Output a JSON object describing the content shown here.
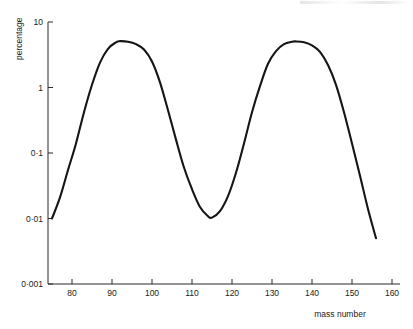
{
  "chart_data": {
    "type": "line",
    "title": "",
    "subtitle": "",
    "xlabel": "mass number",
    "ylabel": "percentage",
    "yscale": "log",
    "xscale": "linear",
    "xlim": [
      74,
      162
    ],
    "ylim": [
      0.001,
      10
    ],
    "grid": false,
    "legend": null,
    "x_ticks": [
      80,
      90,
      100,
      110,
      120,
      130,
      140,
      150,
      160
    ],
    "x_tick_labels": [
      "80",
      "90",
      "100",
      "110",
      "120",
      "130",
      "140",
      "150",
      "160"
    ],
    "y_ticks": [
      10,
      1,
      0.1,
      0.01,
      0.001
    ],
    "y_tick_labels": [
      "10",
      "1",
      "0·1",
      "0·01",
      "0·001"
    ],
    "series": [
      {
        "name": "fission yield",
        "x": [
          75,
          77,
          79,
          81,
          83,
          85,
          87,
          89,
          91,
          92,
          94,
          96,
          98,
          100,
          102,
          104,
          106,
          108,
          110,
          112,
          114,
          115,
          117,
          119,
          121,
          123,
          125,
          127,
          129,
          131,
          133,
          135,
          136,
          138,
          140,
          142,
          144,
          146,
          148,
          150,
          152,
          154,
          156
        ],
        "y": [
          0.01,
          0.021,
          0.055,
          0.14,
          0.42,
          1.1,
          2.4,
          3.9,
          4.9,
          5.1,
          5.0,
          4.6,
          3.8,
          2.5,
          1.2,
          0.45,
          0.16,
          0.06,
          0.028,
          0.015,
          0.0108,
          0.0103,
          0.013,
          0.022,
          0.05,
          0.14,
          0.42,
          1.05,
          2.3,
          3.6,
          4.6,
          5.0,
          5.05,
          4.9,
          4.4,
          3.5,
          2.2,
          1.1,
          0.42,
          0.14,
          0.045,
          0.014,
          0.005
        ]
      }
    ],
    "annotations": {
      "left_peak_mass": 92,
      "left_peak_percentage": 5.1,
      "valley_mass": 115,
      "valley_percentage": 0.0103,
      "right_peak_mass": 136,
      "right_peak_percentage": 5.05,
      "left_tail_start_mass": 75,
      "left_tail_start_percentage": 0.01,
      "right_tail_end_mass": 156,
      "right_tail_end_percentage": 0.005
    },
    "colors": {
      "curve": "#151515",
      "axis": "#2b2b2b",
      "text": "#222222",
      "background": "#ffffff"
    }
  }
}
